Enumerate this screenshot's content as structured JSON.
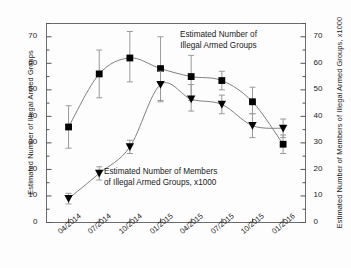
{
  "chart_data": {
    "type": "line",
    "title": "",
    "categories": [
      "04/2014",
      "07/2014",
      "10/2014",
      "01/2015",
      "04/2015",
      "07/2015",
      "10/2015",
      "01/2016"
    ],
    "xlabel": "",
    "ylabel": "Estimated Number of Illegal Armed Groups",
    "y2label": "Estimated Number of Members of Illegal Armed Groups, x1000",
    "ylim": [
      0,
      75
    ],
    "y2lim": [
      0,
      75
    ],
    "yticks": [
      0,
      10,
      20,
      30,
      40,
      50,
      60,
      70
    ],
    "y2ticks": [
      0,
      10,
      20,
      30,
      40,
      50,
      60,
      70
    ],
    "grid": false,
    "legend_position": "inline-annotations",
    "series": [
      {
        "name": "Estimated Number of Illegal Armed Groups",
        "marker": "square",
        "axis": "left",
        "values": [
          36,
          56,
          62,
          58,
          55,
          53.5,
          45.5,
          29.5
        ],
        "err_low": [
          28,
          47,
          53,
          46,
          46,
          50,
          41,
          26
        ],
        "err_high": [
          44,
          65,
          72,
          70,
          63,
          57,
          51,
          33
        ]
      },
      {
        "name": "Estimated Number of Members of Illegal Armed Groups, x1000",
        "marker": "triangle-down",
        "axis": "right",
        "values": [
          9,
          18.5,
          28.5,
          52,
          46.5,
          44.5,
          36.5,
          35.5
        ],
        "err_low": [
          7,
          16,
          26,
          45.5,
          42,
          41,
          32,
          32
        ],
        "err_high": [
          11,
          21,
          31,
          57,
          52,
          48,
          41,
          39
        ]
      }
    ],
    "annotations": [
      {
        "name": "groups-annotation",
        "line1": "Estimated Number of",
        "line2": "Illegal Armed Groups"
      },
      {
        "name": "members-annotation",
        "line1": "Estimated Number of Members",
        "line2": "of Illegal Armed Groups, x1000"
      }
    ],
    "colors": {
      "marker": "#000000",
      "line": "#808080",
      "error_bar": "#9a9a9a",
      "axis": "#555555",
      "text": "#1a1a1a",
      "background": "#fdfdfd"
    }
  }
}
